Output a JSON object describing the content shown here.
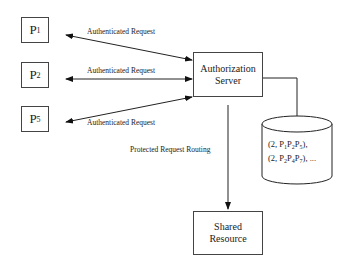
{
  "nodes": {
    "principals": [
      {
        "letter": "P",
        "sub": "1"
      },
      {
        "letter": "P",
        "sub": "2"
      },
      {
        "letter": "P",
        "sub": "5"
      }
    ],
    "auth_server": {
      "line1": "Authorization",
      "line2": "Server"
    },
    "shared_resource": {
      "line1": "Shared",
      "line2": "Resource"
    },
    "database": {
      "rows": [
        {
          "prefix": "(2, ",
          "p": [
            "P",
            "1",
            "P",
            "2",
            "P",
            "5"
          ],
          "suffix": "),"
        },
        {
          "prefix": "(2, ",
          "p": [
            "P",
            "2",
            "P",
            "4",
            "P",
            "7"
          ],
          "suffix": "), ..."
        }
      ]
    }
  },
  "edges": {
    "req1": "Authenticated Request",
    "req2": "Authenticated Request",
    "req3": "Authenticated Request",
    "routing": "Protected Request Routing"
  }
}
